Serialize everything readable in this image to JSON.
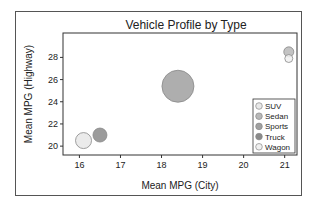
{
  "chart_data": {
    "type": "scatter",
    "subtype": "bubble",
    "title": "Vehicle Profile by Type",
    "xlabel": "Mean MPG (City)",
    "ylabel": "Mean MPG (Highway)",
    "xlim": [
      15.6,
      21.3
    ],
    "ylim": [
      19.2,
      30.2
    ],
    "xticks": [
      16,
      17,
      18,
      19,
      20,
      21
    ],
    "yticks": [
      20,
      22,
      24,
      26,
      28
    ],
    "grid": false,
    "legend_position": "inside-lower-right",
    "series": [
      {
        "name": "SUV",
        "x": 16.1,
        "y": 20.5,
        "size": 8,
        "color": "#e8e8e8"
      },
      {
        "name": "Sedan",
        "x": 21.1,
        "y": 28.5,
        "size": 5,
        "color": "#b8b8b8"
      },
      {
        "name": "Sports",
        "x": 18.4,
        "y": 25.4,
        "size": 16,
        "color": "#a0a0a0"
      },
      {
        "name": "Truck",
        "x": 16.5,
        "y": 21.0,
        "size": 7,
        "color": "#8a8a8a"
      },
      {
        "name": "Wagon",
        "x": 21.1,
        "y": 27.9,
        "size": 4,
        "color": "#f0f0f0"
      }
    ]
  }
}
